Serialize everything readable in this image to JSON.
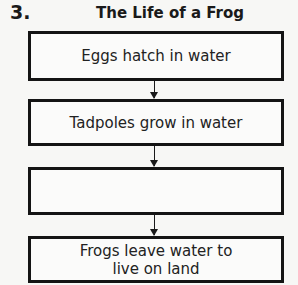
{
  "question_number": "3.",
  "title": "The Life of a Frog",
  "steps": [
    {
      "label": "Eggs hatch in water"
    },
    {
      "label": "Tadpoles grow in water"
    },
    {
      "label": ""
    },
    {
      "label": "Frogs leave water to live on land"
    }
  ]
}
